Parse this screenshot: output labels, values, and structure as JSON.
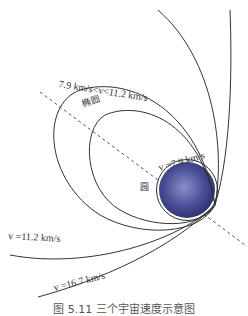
{
  "labels": {
    "ellipse_range": "7.9 km/s<v<11.2 km/s",
    "ellipse": "椭圆",
    "circle_speed": "v =7.9 km/s",
    "circle": "圆",
    "escape": "v =11.2 km/s",
    "third": "v =16.7 km/s"
  },
  "caption": "图 5.11 三个宇宙速度示意图",
  "colors": {
    "line": "#333333",
    "earth": "#4a4f9a",
    "dash": "#555555"
  }
}
